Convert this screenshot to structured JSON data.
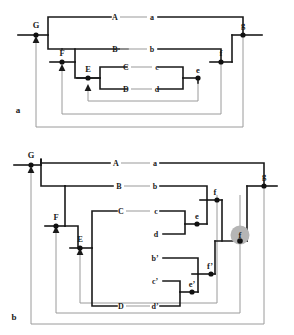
{
  "figure": {
    "title_visible": false,
    "panels": [
      {
        "id": "a",
        "label": "a",
        "description": "Upper nested network diagram with nodes G, F, E and segment labels A-a, B-b, C-c, D-d and right side nodes e, f, g",
        "nodes": [
          {
            "name": "G",
            "label": "G"
          },
          {
            "name": "F",
            "label": "F"
          },
          {
            "name": "E",
            "label": "E"
          },
          {
            "name": "e",
            "label": "e"
          },
          {
            "name": "f",
            "label": "f"
          },
          {
            "name": "g",
            "label": "g"
          }
        ],
        "segments": [
          {
            "left": "A",
            "right": "a"
          },
          {
            "left": "B",
            "right": "b"
          },
          {
            "left": "C",
            "right": "c"
          },
          {
            "left": "D",
            "right": "d"
          }
        ]
      },
      {
        "id": "b",
        "label": "b",
        "description": "Lower nested network diagram with nodes G, F, E and segment labels A-a, B-b, C-c, d, b', c', D-d' plus right side nodes e, f, e', f', highlighted f, g",
        "nodes": [
          {
            "name": "G",
            "label": "G"
          },
          {
            "name": "F",
            "label": "F"
          },
          {
            "name": "E",
            "label": "E"
          },
          {
            "name": "e",
            "label": "e"
          },
          {
            "name": "f",
            "label": "f"
          },
          {
            "name": "e-prime",
            "label": "e’"
          },
          {
            "name": "f-prime",
            "label": "f’"
          },
          {
            "name": "f-highlighted",
            "label": "f",
            "highlighted": true
          },
          {
            "name": "g",
            "label": "g"
          }
        ],
        "segments": [
          {
            "left": "A",
            "right": "a"
          },
          {
            "left": "B",
            "right": "b"
          },
          {
            "left": "C",
            "right": "c"
          },
          {
            "left": "",
            "right": "d"
          },
          {
            "left": "",
            "right": "b’"
          },
          {
            "left": "",
            "right": "c’"
          },
          {
            "left": "D",
            "right": "d’"
          }
        ]
      }
    ],
    "colors": {
      "line_dark": "#1a1a1a",
      "line_light": "#9a9a9a",
      "node_fill": "#111111",
      "highlight_fill": "#b5b5b5",
      "background": "#ffffff"
    }
  },
  "labels": {
    "panel_a": "a",
    "panel_b": "b",
    "a_G": "G",
    "a_F": "F",
    "a_E": "E",
    "a_e": "e",
    "a_f": "f",
    "a_g": "g",
    "a_A": "A",
    "a_a": "a",
    "a_B": "B",
    "a_b": "b",
    "a_C": "C",
    "a_c": "c",
    "a_D": "D",
    "a_d": "d",
    "b_G": "G",
    "b_F": "F",
    "b_E": "E",
    "b_e": "e",
    "b_f": "f",
    "b_eprime": "e’",
    "b_fprime": "f’",
    "b_fhigh": "f",
    "b_g": "g",
    "b_A": "A",
    "b_a": "a",
    "b_B": "B",
    "b_b": "b",
    "b_C": "C",
    "b_c": "c",
    "b_d": "d",
    "b_bprime": "b’",
    "b_cprime": "c’",
    "b_D": "D",
    "b_dprime": "d’"
  }
}
